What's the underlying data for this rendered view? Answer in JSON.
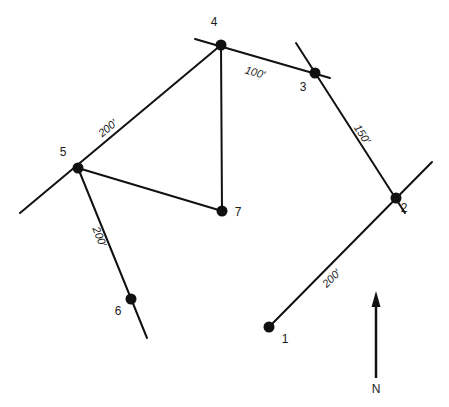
{
  "diagram": {
    "type": "survey-traverse",
    "stations": [
      {
        "id": "1",
        "x": 269,
        "y": 327,
        "label_x": 285,
        "label_y": 343
      },
      {
        "id": "2",
        "x": 396,
        "y": 198,
        "label_x": 404,
        "label_y": 212
      },
      {
        "id": "3",
        "x": 315,
        "y": 73,
        "label_x": 303,
        "label_y": 91
      },
      {
        "id": "4",
        "x": 221,
        "y": 45,
        "label_x": 214,
        "label_y": 26
      },
      {
        "id": "5",
        "x": 78,
        "y": 168,
        "label_x": 63,
        "label_y": 156
      },
      {
        "id": "6",
        "x": 131,
        "y": 299,
        "label_x": 118,
        "label_y": 315
      },
      {
        "id": "7",
        "x": 222,
        "y": 211,
        "label_x": 238,
        "label_y": 216
      }
    ],
    "lines": [
      {
        "from": "4-ext",
        "x1": 195,
        "y1": 39,
        "x2": 330,
        "y2": 78
      },
      {
        "from": "3-ext",
        "x1": 296,
        "y1": 43,
        "x2": 405,
        "y2": 213
      },
      {
        "from": "2-1",
        "x1": 432,
        "y1": 162,
        "x2": 269,
        "y2": 327
      },
      {
        "from": "5-4",
        "x1": 20,
        "y1": 213,
        "x2": 221,
        "y2": 45
      },
      {
        "from": "4-7",
        "x1": 221,
        "y1": 45,
        "x2": 222,
        "y2": 211
      },
      {
        "from": "5-7",
        "x1": 78,
        "y1": 168,
        "x2": 222,
        "y2": 211
      },
      {
        "from": "5-6",
        "x1": 78,
        "y1": 168,
        "x2": 147,
        "y2": 338
      }
    ],
    "dimensions": [
      {
        "text": "100′",
        "x": 254,
        "y": 76,
        "rotate": 16
      },
      {
        "text": "150′",
        "x": 359,
        "y": 136,
        "rotate": 57
      },
      {
        "text": "200′",
        "x": 334,
        "y": 281,
        "rotate": -45
      },
      {
        "text": "200′",
        "x": 110,
        "y": 131,
        "rotate": -40
      },
      {
        "text": "200′",
        "x": 96,
        "y": 238,
        "rotate": 68
      }
    ],
    "north_arrow": {
      "label": "N",
      "x": 376,
      "y_tip": 291,
      "y_tail": 378,
      "label_y": 393
    }
  }
}
